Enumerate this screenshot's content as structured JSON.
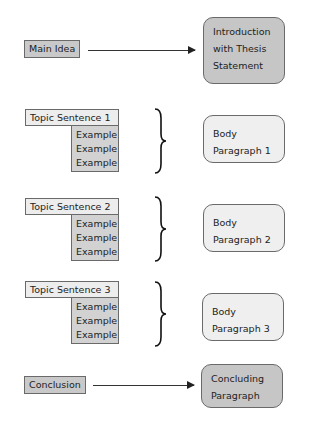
{
  "diagram": {
    "intro": {
      "source_label": "Main Idea",
      "target_label": "Introduction with Thesis Statement"
    },
    "body_groups": [
      {
        "topic": "Topic Sentence 1",
        "examples": [
          "Example",
          "Example",
          "Example"
        ],
        "target_label": "Body Paragraph 1"
      },
      {
        "topic": "Topic Sentence 2",
        "examples": [
          "Example",
          "Example",
          "Example"
        ],
        "target_label": "Body Paragraph 2"
      },
      {
        "topic": "Topic Sentence 3",
        "examples": [
          "Example",
          "Example",
          "Example"
        ],
        "target_label": "Body Paragraph 3"
      }
    ],
    "conclusion": {
      "source_label": "Conclusion",
      "target_label": "Concluding Paragraph"
    },
    "colors": {
      "dark_fill": "#c6c6c6",
      "light_fill": "#efefef",
      "example_fill": "#d2d2d2",
      "border": "#6a6a6a",
      "line": "#333333"
    }
  }
}
